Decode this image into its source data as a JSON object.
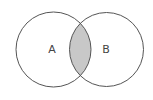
{
  "diagram": {
    "type": "venn",
    "sets": [
      {
        "id": "A",
        "label": "A",
        "cx": 53.5,
        "cy": 49.5,
        "r": 37.5
      },
      {
        "id": "B",
        "label": "B",
        "cx": 106.5,
        "cy": 49.5,
        "r": 37
      }
    ],
    "shaded_region": "A ∩ B",
    "colors": {
      "background": "#ffffff",
      "stroke": "#555555",
      "intersection_fill": "#c8c8c8",
      "label": "#444444"
    }
  }
}
